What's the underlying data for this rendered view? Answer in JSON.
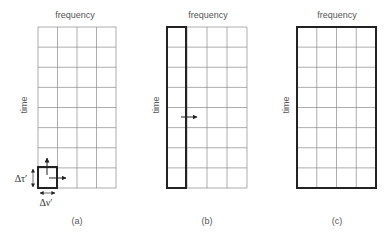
{
  "canvas": {
    "width": 387,
    "height": 233,
    "background": "#ffffff"
  },
  "colors": {
    "grid_line": "#8a8a8a",
    "thick_border": "#222222",
    "arrow": "#222222",
    "label": "#555555"
  },
  "grid": {
    "rows": 8,
    "cols": 4,
    "top": 27,
    "bottom": 188
  },
  "panels": [
    {
      "id": "a",
      "caption": "(a)",
      "x_axis_label": "frequency",
      "y_axis_label": "time",
      "left": 38,
      "right": 116,
      "caption_x": 77,
      "time_label_x": 24,
      "highlight": {
        "type": "cell",
        "col": 0,
        "row": 7
      },
      "arrows": [
        {
          "name": "up-arrow",
          "x1": 47,
          "y1": 175,
          "x2": 47,
          "y2": 158
        },
        {
          "name": "right-arrow",
          "x1": 49,
          "y1": 178,
          "x2": 66,
          "y2": 178
        }
      ],
      "dimension_labels": {
        "delta_tau": {
          "text": "Δτ′",
          "x": 21,
          "y": 182
        },
        "delta_nu": {
          "text": "Δν′",
          "x": 46,
          "y": 206
        }
      }
    },
    {
      "id": "b",
      "caption": "(b)",
      "x_axis_label": "frequency",
      "y_axis_label": "time",
      "left": 167,
      "right": 247,
      "caption_x": 207,
      "time_label_x": 156,
      "highlight": {
        "type": "column",
        "col": 0
      },
      "arrows": [
        {
          "name": "right-arrow",
          "x1": 181,
          "y1": 117,
          "x2": 197,
          "y2": 117
        }
      ]
    },
    {
      "id": "c",
      "caption": "(c)",
      "x_axis_label": "frequency",
      "y_axis_label": "time",
      "left": 297,
      "right": 376,
      "caption_x": 337,
      "time_label_x": 286,
      "highlight": {
        "type": "all"
      },
      "arrows": []
    }
  ],
  "caption_y": 224,
  "freq_label_y": 18
}
